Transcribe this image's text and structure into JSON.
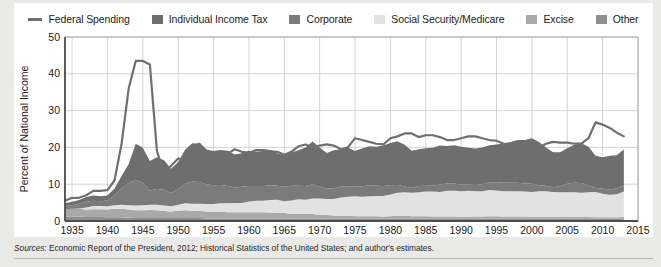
{
  "figure": {
    "source_prefix": "Sources:",
    "source_text": " Economic Report of the President, 2012; Historical Statistics of the United States; and author's estimates."
  },
  "legend": {
    "position": "top",
    "items": [
      {
        "label": "Federal Spending",
        "color": "#6f6f6f",
        "marker": "line",
        "name": "federal-spending"
      },
      {
        "label": "Individual Income Tax",
        "color": "#6e6e6e",
        "marker": "swatch",
        "name": "individual-income-tax"
      },
      {
        "label": "Corporate",
        "color": "#7b7b7b",
        "marker": "swatch",
        "name": "corporate"
      },
      {
        "label": "Social Security/Medicare",
        "color": "#e2e2e2",
        "marker": "swatch",
        "name": "social-security-medicare"
      },
      {
        "label": "Excise",
        "color": "#a9a9a9",
        "marker": "swatch",
        "name": "excise"
      },
      {
        "label": "Other",
        "color": "#8f8f8f",
        "marker": "swatch",
        "name": "other"
      }
    ]
  },
  "chart_data": {
    "type": "area",
    "title": "",
    "subtitle": "",
    "xlabel": "",
    "ylabel": "Percent of National Income",
    "xlim": [
      1934,
      2015
    ],
    "ylim": [
      0,
      50
    ],
    "ytick_values": [
      0,
      10,
      20,
      30,
      40,
      50
    ],
    "ytick_labels": [
      "0",
      "10",
      "20",
      "30",
      "40",
      "50"
    ],
    "xtick_values": [
      1935,
      1940,
      1945,
      1950,
      1955,
      1960,
      1965,
      1970,
      1975,
      1980,
      1985,
      1990,
      1995,
      2000,
      2005,
      2010,
      2015
    ],
    "xtick_labels": [
      "1935",
      "1940",
      "1945",
      "1950",
      "1955",
      "1960",
      "1965",
      "1970",
      "1975",
      "1980",
      "1985",
      "1990",
      "1995",
      "2000",
      "2005",
      "2010",
      "2015"
    ],
    "grid": true,
    "stacked": true,
    "stack_order_bottom_to_top": [
      "Other",
      "Excise",
      "Social Security/Medicare",
      "Corporate",
      "Individual Income Tax"
    ],
    "x": [
      1934,
      1935,
      1936,
      1937,
      1938,
      1939,
      1940,
      1941,
      1942,
      1943,
      1944,
      1945,
      1946,
      1947,
      1948,
      1949,
      1950,
      1951,
      1952,
      1953,
      1954,
      1955,
      1956,
      1957,
      1958,
      1959,
      1960,
      1961,
      1962,
      1963,
      1964,
      1965,
      1966,
      1967,
      1968,
      1969,
      1970,
      1971,
      1972,
      1973,
      1974,
      1975,
      1976,
      1977,
      1978,
      1979,
      1980,
      1981,
      1982,
      1983,
      1984,
      1985,
      1986,
      1987,
      1988,
      1989,
      1990,
      1991,
      1992,
      1993,
      1994,
      1995,
      1996,
      1997,
      1998,
      1999,
      2000,
      2001,
      2002,
      2003,
      2004,
      2005,
      2006,
      2007,
      2008,
      2009,
      2010,
      2011,
      2012,
      2013
    ],
    "series": [
      {
        "name": "Individual Income Tax",
        "color": "#6e6e6e",
        "values": [
          0.8,
          0.9,
          1.0,
          1.3,
          1.4,
          1.3,
          1.3,
          1.8,
          3.3,
          5.2,
          9.8,
          9.5,
          8.0,
          8.6,
          8.0,
          6.6,
          7.3,
          9.2,
          10.4,
          10.3,
          9.4,
          9.3,
          9.5,
          9.6,
          9.0,
          9.1,
          9.6,
          9.4,
          9.5,
          9.6,
          8.8,
          8.6,
          9.0,
          9.6,
          10.5,
          11.6,
          10.6,
          9.7,
          10.3,
          10.1,
          10.6,
          9.7,
          10.3,
          10.6,
          10.6,
          11.0,
          11.5,
          11.9,
          11.3,
          10.1,
          10.0,
          10.2,
          10.3,
          10.6,
          10.2,
          10.4,
          10.3,
          10.0,
          9.9,
          10.0,
          10.1,
          10.3,
          10.7,
          11.1,
          11.6,
          11.8,
          12.4,
          11.8,
          10.4,
          9.5,
          9.2,
          9.7,
          10.3,
          10.8,
          10.5,
          8.7,
          8.5,
          9.2,
          9.0,
          9.6
        ]
      },
      {
        "name": "Corporate",
        "color": "#7b7b7b",
        "values": [
          0.8,
          1.0,
          1.3,
          1.5,
          1.4,
          1.3,
          1.6,
          2.7,
          4.5,
          6.0,
          7.0,
          6.1,
          3.9,
          4.3,
          4.3,
          3.6,
          4.3,
          5.4,
          6.0,
          5.9,
          5.4,
          5.1,
          5.0,
          4.7,
          4.2,
          4.4,
          4.2,
          4.0,
          4.0,
          4.0,
          3.8,
          3.9,
          4.0,
          3.7,
          3.7,
          3.9,
          3.3,
          2.8,
          2.9,
          3.0,
          2.8,
          2.6,
          2.8,
          3.0,
          2.8,
          2.7,
          2.5,
          2.1,
          1.6,
          1.3,
          1.7,
          1.6,
          1.6,
          2.0,
          2.0,
          2.0,
          1.8,
          1.7,
          1.7,
          1.9,
          2.1,
          2.2,
          2.3,
          2.3,
          2.3,
          2.2,
          2.2,
          1.6,
          1.5,
          1.3,
          1.7,
          2.3,
          2.6,
          2.6,
          1.9,
          1.1,
          1.4,
          1.4,
          1.6,
          1.8
        ]
      },
      {
        "name": "Social Security/Medicare",
        "color": "#e2e2e2",
        "values": [
          0.0,
          0.0,
          0.1,
          0.6,
          0.9,
          0.9,
          0.9,
          1.0,
          1.1,
          1.2,
          1.3,
          1.4,
          1.4,
          1.5,
          1.5,
          1.4,
          1.6,
          1.9,
          1.9,
          1.9,
          2.0,
          2.1,
          2.3,
          2.4,
          2.5,
          2.5,
          2.9,
          3.1,
          3.1,
          3.4,
          3.5,
          3.2,
          3.6,
          4.0,
          3.9,
          4.2,
          4.4,
          4.4,
          4.5,
          5.0,
          5.2,
          5.4,
          5.3,
          5.4,
          5.5,
          5.6,
          5.9,
          6.2,
          6.4,
          6.4,
          6.5,
          6.7,
          6.8,
          6.7,
          7.0,
          7.0,
          7.0,
          7.0,
          6.9,
          6.9,
          7.1,
          7.0,
          6.9,
          6.9,
          6.9,
          6.8,
          6.8,
          7.0,
          7.0,
          6.8,
          6.7,
          6.7,
          6.7,
          6.6,
          6.7,
          6.9,
          6.4,
          6.1,
          6.3,
          6.9
        ]
      },
      {
        "name": "Excise",
        "color": "#a9a9a9",
        "values": [
          2.0,
          2.1,
          2.1,
          2.0,
          2.1,
          2.1,
          2.1,
          2.3,
          2.3,
          2.2,
          2.1,
          2.1,
          2.2,
          2.1,
          1.9,
          1.8,
          2.0,
          2.1,
          2.0,
          2.0,
          1.9,
          1.8,
          1.8,
          1.7,
          1.7,
          1.7,
          1.7,
          1.7,
          1.7,
          1.6,
          1.6,
          1.5,
          1.3,
          1.2,
          1.2,
          1.2,
          1.0,
          1.0,
          0.9,
          0.8,
          0.8,
          0.7,
          0.7,
          0.7,
          0.7,
          0.6,
          0.7,
          0.9,
          0.8,
          0.7,
          0.7,
          0.7,
          0.6,
          0.6,
          0.6,
          0.6,
          0.5,
          0.6,
          0.6,
          0.6,
          0.7,
          0.7,
          0.6,
          0.6,
          0.6,
          0.6,
          0.5,
          0.5,
          0.5,
          0.5,
          0.5,
          0.5,
          0.5,
          0.5,
          0.5,
          0.4,
          0.4,
          0.4,
          0.4,
          0.5
        ]
      },
      {
        "name": "Other",
        "color": "#8f8f8f",
        "values": [
          1.2,
          1.2,
          1.2,
          1.1,
          1.1,
          1.1,
          1.0,
          1.0,
          1.0,
          0.9,
          0.8,
          0.8,
          0.8,
          0.8,
          0.8,
          0.8,
          0.8,
          0.8,
          0.8,
          0.8,
          0.7,
          0.7,
          0.7,
          0.7,
          0.7,
          0.7,
          0.7,
          0.7,
          0.7,
          0.7,
          0.7,
          0.7,
          0.7,
          0.7,
          0.7,
          0.7,
          0.7,
          0.6,
          0.6,
          0.6,
          0.6,
          0.6,
          0.6,
          0.6,
          0.6,
          0.6,
          0.6,
          0.6,
          0.6,
          0.6,
          0.6,
          0.6,
          0.6,
          0.6,
          0.6,
          0.6,
          0.6,
          0.6,
          0.6,
          0.6,
          0.6,
          0.6,
          0.6,
          0.6,
          0.6,
          0.6,
          0.6,
          0.6,
          0.6,
          0.6,
          0.6,
          0.6,
          0.6,
          0.6,
          0.6,
          0.6,
          0.6,
          0.6,
          0.6,
          0.6
        ]
      }
    ],
    "line_series": {
      "name": "Federal Spending",
      "color": "#6f6f6f",
      "width": 2.2,
      "values": [
        5.5,
        6.3,
        6.3,
        7.0,
        8.2,
        8.2,
        8.4,
        11.0,
        21.0,
        36.0,
        43.5,
        43.5,
        42.5,
        19.0,
        13.0,
        15.0,
        17.0,
        16.0,
        20.5,
        21.0,
        19.0,
        18.0,
        17.5,
        18.3,
        19.5,
        18.8,
        18.5,
        19.3,
        19.3,
        19.0,
        18.8,
        18.0,
        18.8,
        20.3,
        20.8,
        20.0,
        20.5,
        20.8,
        20.5,
        19.5,
        20.0,
        22.5,
        22.0,
        21.5,
        21.0,
        20.8,
        22.5,
        23.0,
        23.8,
        23.8,
        22.8,
        23.3,
        23.3,
        22.8,
        22.0,
        22.0,
        22.5,
        23.0,
        23.0,
        22.5,
        22.0,
        21.8,
        21.0,
        20.3,
        19.8,
        19.5,
        19.3,
        20.0,
        21.0,
        21.5,
        21.3,
        21.3,
        21.0,
        21.0,
        22.5,
        26.8,
        26.2,
        25.3,
        24.0,
        23.0
      ]
    }
  }
}
